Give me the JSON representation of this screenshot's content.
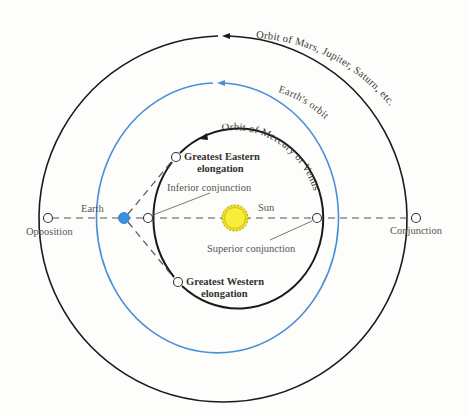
{
  "diagram": {
    "colors": {
      "orbit_outer": "#1a1a1a",
      "orbit_earth": "#4a90d9",
      "orbit_inner": "#1a1a1a",
      "earth_fill": "#3b8fe0",
      "sun_fill": "#f7ee3a",
      "sun_stroke": "#b5a800",
      "dash": "#555555"
    },
    "orbits": {
      "outer_label": "Orbit of Mars, Jupiter, Saturn, etc.",
      "earth_label": "Earth's orbit",
      "inner_label": "Orbit of Mercury or Venus"
    },
    "bodies": {
      "sun": "Sun",
      "earth": "Earth"
    },
    "positions": {
      "opposition": "Opposition",
      "conjunction": "Conjunction",
      "inferior_conjunction": "Inferior conjunction",
      "superior_conjunction": "Superior conjunction",
      "greatest_eastern_1": "Greatest Eastern",
      "greatest_eastern_2": "elongation",
      "greatest_western_1": "Greatest Western",
      "greatest_western_2": "elongation"
    }
  }
}
